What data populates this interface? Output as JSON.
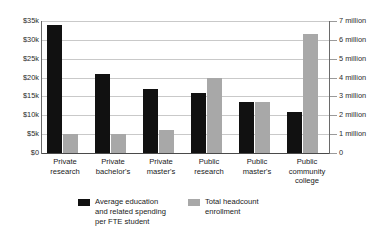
{
  "chart_data": {
    "type": "bar",
    "title": "",
    "subtitle": "",
    "xlabel": "",
    "grid": true,
    "legend_position": "bottom",
    "categories": [
      "Private research",
      "Private bachelor's",
      "Private master's",
      "Public research",
      "Public master's",
      "Public community college"
    ],
    "category_lines": [
      [
        "Private",
        "research"
      ],
      [
        "Private",
        "bachelor's"
      ],
      [
        "Private",
        "master's"
      ],
      [
        "Public",
        "research"
      ],
      [
        "Public",
        "master's"
      ],
      [
        "Public",
        "community",
        "college"
      ]
    ],
    "series": [
      {
        "name": "Average education and related spending per FTE student",
        "name_lines": [
          "Average education",
          "and related spending",
          "per FTE student"
        ],
        "axis": "left",
        "color": "#111111",
        "unit": "USD",
        "values": [
          34000,
          21000,
          17000,
          16000,
          13500,
          11000
        ]
      },
      {
        "name": "Total headcount enrollment",
        "name_lines": [
          "Total headcount",
          "enrollment"
        ],
        "axis": "right",
        "color": "#a8a8a8",
        "unit": "people",
        "values": [
          1000000,
          1000000,
          1200000,
          4000000,
          2700000,
          6300000
        ]
      }
    ],
    "left_axis": {
      "label": "",
      "ylim": [
        0,
        35000
      ],
      "tick_values": [
        35000,
        30000,
        25000,
        20000,
        15000,
        10000,
        5000,
        0
      ],
      "tick_labels": [
        "$35k",
        "$30k",
        "$25k",
        "$20k",
        "$15k",
        "$10k",
        "$5k",
        "$0"
      ]
    },
    "right_axis": {
      "label": "",
      "ylim": [
        0,
        7000000
      ],
      "tick_values": [
        7000000,
        6000000,
        5000000,
        4000000,
        3000000,
        2000000,
        1000000,
        0
      ],
      "tick_labels": [
        "7 million",
        "6 million",
        "5 million",
        "4 million",
        "3 million",
        "2 million",
        "1 million",
        "0"
      ]
    }
  },
  "legend": {
    "items": [
      {
        "swatch_color": "#111111",
        "lines": [
          "Average education",
          "and related spending",
          "per FTE student"
        ]
      },
      {
        "swatch_color": "#a8a8a8",
        "lines": [
          "Total headcount",
          "enrollment"
        ]
      }
    ]
  }
}
